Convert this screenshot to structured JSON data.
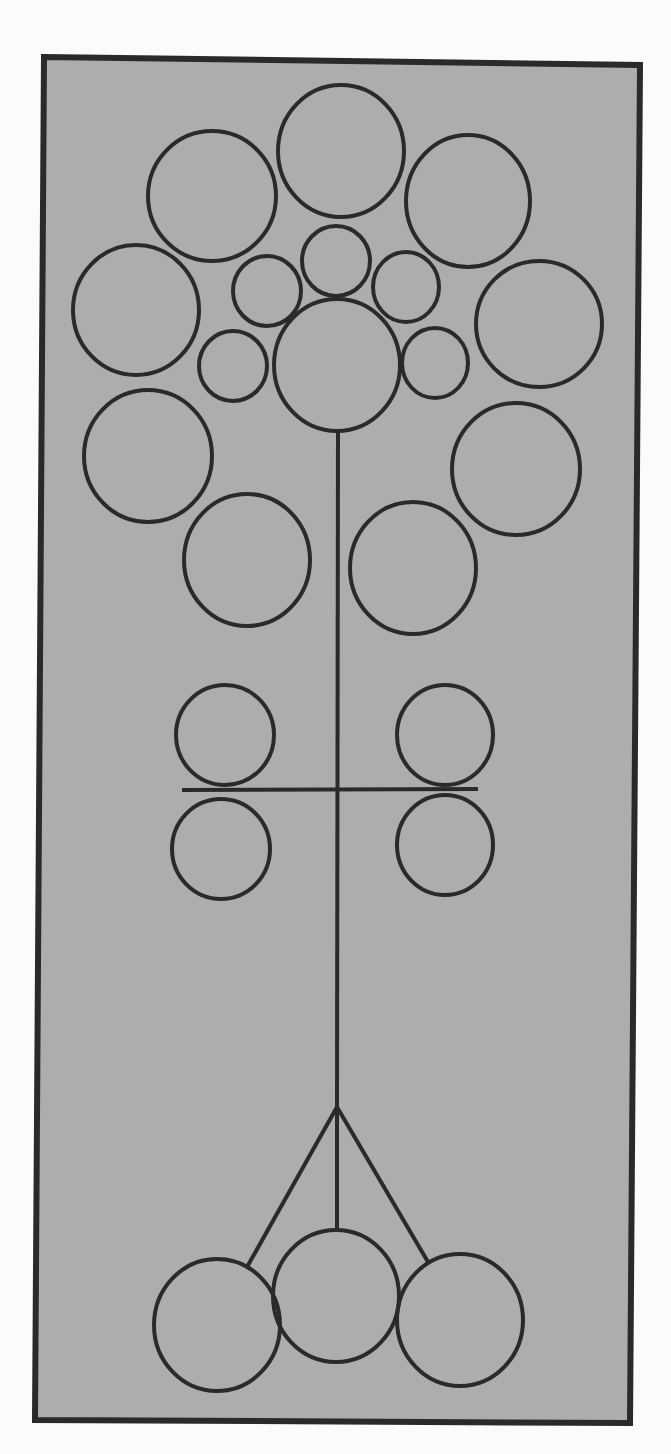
{
  "diagram": {
    "type": "tree-of-circles",
    "colors": {
      "page_background": "#fbfbfb",
      "panel_fill": "#adadad",
      "stroke": "#2a2a2a"
    },
    "panel": {
      "points": [
        [
          44,
          57
        ],
        [
          640,
          65
        ],
        [
          630,
          1423
        ],
        [
          35,
          1420
        ]
      ],
      "border_width": 6
    },
    "stroke_width": 4,
    "crown_circles": [
      {
        "id": "top-center",
        "cx": 341,
        "cy": 151,
        "rx": 63,
        "ry": 66
      },
      {
        "id": "top-left",
        "cx": 212,
        "cy": 196,
        "rx": 64,
        "ry": 65
      },
      {
        "id": "top-right",
        "cx": 468,
        "cy": 201,
        "rx": 62,
        "ry": 66
      },
      {
        "id": "mid-left",
        "cx": 136,
        "cy": 310,
        "rx": 63,
        "ry": 65
      },
      {
        "id": "mid-right",
        "cx": 539,
        "cy": 324,
        "rx": 63,
        "ry": 63
      },
      {
        "id": "small-top",
        "cx": 336,
        "cy": 261,
        "rx": 34,
        "ry": 35
      },
      {
        "id": "small-upper-left",
        "cx": 267,
        "cy": 291,
        "rx": 34,
        "ry": 35
      },
      {
        "id": "small-upper-right",
        "cx": 406,
        "cy": 287,
        "rx": 33,
        "ry": 35
      },
      {
        "id": "center",
        "cx": 337,
        "cy": 365,
        "rx": 63,
        "ry": 66
      },
      {
        "id": "small-lower-left",
        "cx": 233,
        "cy": 366,
        "rx": 34,
        "ry": 35
      },
      {
        "id": "small-lower-right",
        "cx": 435,
        "cy": 363,
        "rx": 33,
        "ry": 35
      },
      {
        "id": "lower-left",
        "cx": 148,
        "cy": 456,
        "rx": 64,
        "ry": 66
      },
      {
        "id": "lower-right",
        "cx": 516,
        "cy": 469,
        "rx": 64,
        "ry": 66
      },
      {
        "id": "bottom-left",
        "cx": 247,
        "cy": 560,
        "rx": 63,
        "ry": 66
      },
      {
        "id": "bottom-right",
        "cx": 413,
        "cy": 568,
        "rx": 63,
        "ry": 66
      }
    ],
    "crossbar_circles": [
      {
        "id": "upper-left",
        "cx": 225,
        "cy": 735,
        "rx": 49,
        "ry": 50
      },
      {
        "id": "upper-right",
        "cx": 445,
        "cy": 735,
        "rx": 48,
        "ry": 50
      },
      {
        "id": "lower-left",
        "cx": 221,
        "cy": 849,
        "rx": 49,
        "ry": 50
      },
      {
        "id": "lower-right",
        "cx": 445,
        "cy": 845,
        "rx": 48,
        "ry": 50
      }
    ],
    "root_circles": [
      {
        "id": "root-left",
        "cx": 217,
        "cy": 1325,
        "rx": 63,
        "ry": 66
      },
      {
        "id": "root-center",
        "cx": 336,
        "cy": 1296,
        "rx": 63,
        "ry": 66
      },
      {
        "id": "root-right",
        "cx": 460,
        "cy": 1320,
        "rx": 63,
        "ry": 66
      }
    ],
    "lines": [
      {
        "id": "stem",
        "x1": 338,
        "y1": 431,
        "x2": 337,
        "y2": 1107
      },
      {
        "id": "crossbar",
        "x1": 182,
        "y1": 790,
        "x2": 478,
        "y2": 789
      },
      {
        "id": "branch-left",
        "x1": 337,
        "y1": 1107,
        "x2": 247,
        "y2": 1267
      },
      {
        "id": "branch-center",
        "x1": 337,
        "y1": 1107,
        "x2": 337,
        "y2": 1230
      },
      {
        "id": "branch-right",
        "x1": 337,
        "y1": 1107,
        "x2": 428,
        "y2": 1262
      }
    ]
  }
}
